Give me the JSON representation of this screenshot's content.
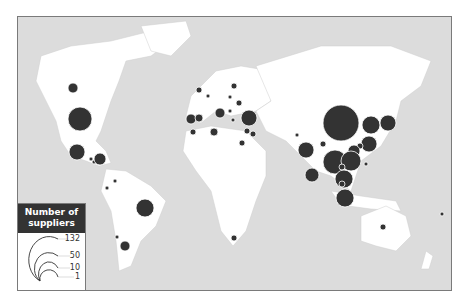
{
  "legend": {
    "title_line1": "Number of",
    "title_line2": "suppliers",
    "values": [
      "132",
      "50",
      "10",
      "1"
    ]
  },
  "colors": {
    "ocean": "#dcdcdc",
    "land": "#ffffff",
    "bubble": "#333333",
    "bubble_stroke": "#ffffff",
    "legend_header": "#333333"
  },
  "bubbles": [
    {
      "region": "Canada",
      "cx": 72,
      "cy": 87,
      "r": 5
    },
    {
      "region": "United States",
      "cx": 79,
      "cy": 118,
      "r": 12
    },
    {
      "region": "Mexico",
      "cx": 76,
      "cy": 151,
      "r": 8
    },
    {
      "region": "Central America 1",
      "cx": 90,
      "cy": 158,
      "r": 2
    },
    {
      "region": "Central America 2",
      "cx": 93,
      "cy": 161,
      "r": 2
    },
    {
      "region": "Caribbean",
      "cx": 99,
      "cy": 158,
      "r": 6
    },
    {
      "region": "Colombia",
      "cx": 114,
      "cy": 180,
      "r": 2
    },
    {
      "region": "Ecuador",
      "cx": 106,
      "cy": 187,
      "r": 2
    },
    {
      "region": "Brazil",
      "cx": 144,
      "cy": 207,
      "r": 9
    },
    {
      "region": "Chile",
      "cx": 116,
      "cy": 236,
      "r": 2
    },
    {
      "region": "Argentina",
      "cx": 124,
      "cy": 245,
      "r": 5
    },
    {
      "region": "United Kingdom",
      "cx": 198,
      "cy": 89,
      "r": 3
    },
    {
      "region": "Netherlands",
      "cx": 207,
      "cy": 95,
      "r": 2
    },
    {
      "region": "Scandinavia",
      "cx": 233,
      "cy": 85,
      "r": 3
    },
    {
      "region": "Germany",
      "cx": 229,
      "cy": 96,
      "r": 2
    },
    {
      "region": "Eastern Europe",
      "cx": 238,
      "cy": 102,
      "r": 3
    },
    {
      "region": "Portugal",
      "cx": 190,
      "cy": 118,
      "r": 5
    },
    {
      "region": "Spain",
      "cx": 198,
      "cy": 117,
      "r": 4
    },
    {
      "region": "Italy",
      "cx": 219,
      "cy": 112,
      "r": 5
    },
    {
      "region": "Balkans",
      "cx": 229,
      "cy": 110,
      "r": 2
    },
    {
      "region": "Greece",
      "cx": 232,
      "cy": 119,
      "r": 2
    },
    {
      "region": "Turkey",
      "cx": 248,
      "cy": 117,
      "r": 8
    },
    {
      "region": "Morocco",
      "cx": 192,
      "cy": 131,
      "r": 3
    },
    {
      "region": "Tunisia",
      "cx": 213,
      "cy": 131,
      "r": 4
    },
    {
      "region": "Israel",
      "cx": 246,
      "cy": 130,
      "r": 3
    },
    {
      "region": "Jordan",
      "cx": 252,
      "cy": 133,
      "r": 3
    },
    {
      "region": "Egypt",
      "cx": 241,
      "cy": 142,
      "r": 3
    },
    {
      "region": "South Africa",
      "cx": 233,
      "cy": 237,
      "r": 3
    },
    {
      "region": "Pakistan",
      "cx": 296,
      "cy": 134,
      "r": 2
    },
    {
      "region": "India",
      "cx": 305,
      "cy": 149,
      "r": 8
    },
    {
      "region": "Nepal",
      "cx": 322,
      "cy": 143,
      "r": 3
    },
    {
      "region": "China",
      "cx": 340,
      "cy": 122,
      "r": 18
    },
    {
      "region": "Korea",
      "cx": 370,
      "cy": 124,
      "r": 9
    },
    {
      "region": "Japan",
      "cx": 387,
      "cy": 122,
      "r": 8
    },
    {
      "region": "Taiwan",
      "cx": 368,
      "cy": 143,
      "r": 8
    },
    {
      "region": "Hong Kong",
      "cx": 359,
      "cy": 145,
      "r": 3
    },
    {
      "region": "Vietnam",
      "cx": 353,
      "cy": 150,
      "r": 6
    },
    {
      "region": "Bangladesh",
      "cx": 334,
      "cy": 161,
      "r": 12
    },
    {
      "region": "Thailand",
      "cx": 350,
      "cy": 160,
      "r": 10
    },
    {
      "region": "Cambodia",
      "cx": 341,
      "cy": 166,
      "r": 3
    },
    {
      "region": "Philippines",
      "cx": 365,
      "cy": 163,
      "r": 2
    },
    {
      "region": "Sri Lanka",
      "cx": 311,
      "cy": 174,
      "r": 7
    },
    {
      "region": "Malaysia",
      "cx": 343,
      "cy": 178,
      "r": 9
    },
    {
      "region": "Singapore",
      "cx": 341,
      "cy": 183,
      "r": 3
    },
    {
      "region": "Indonesia",
      "cx": 344,
      "cy": 197,
      "r": 9
    },
    {
      "region": "Australia",
      "cx": 382,
      "cy": 226,
      "r": 3
    },
    {
      "region": "Pacific",
      "cx": 441,
      "cy": 213,
      "r": 2
    }
  ]
}
